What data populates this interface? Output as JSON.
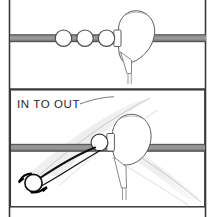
{
  "figure": {
    "panels": [
      {
        "id": "top-panel",
        "name": "square-path-panel",
        "caption": "",
        "elements": [
          {
            "name": "target-line",
            "type": "bar",
            "color": "#8c8c8c"
          },
          {
            "name": "golf-ball-1",
            "type": "ball",
            "color": "#ffffff"
          },
          {
            "name": "golf-ball-2",
            "type": "ball",
            "color": "#ffffff"
          },
          {
            "name": "golf-ball-3",
            "type": "ball",
            "color": "#ffffff"
          },
          {
            "name": "driver-club-head",
            "type": "clubhead",
            "color": "#ffffff"
          }
        ]
      },
      {
        "id": "bottom-panel",
        "name": "in-to-out-path-panel",
        "caption": "IN TO OUT",
        "elements": [
          {
            "name": "target-line",
            "type": "bar",
            "color": "#8c8c8c"
          },
          {
            "name": "swing-path-band",
            "type": "band",
            "color": "#f0f0f0"
          },
          {
            "name": "golf-ball-contact",
            "type": "ball",
            "color": "#ffffff"
          },
          {
            "name": "golf-ball-flight",
            "type": "ball",
            "color": "#ffffff"
          },
          {
            "name": "ball-flight-curve",
            "type": "curve",
            "color": "#1a1a1a"
          },
          {
            "name": "spin-arrow-upper",
            "type": "arrow",
            "color": "#000000"
          },
          {
            "name": "spin-arrow-lower",
            "type": "arrow",
            "color": "#000000"
          },
          {
            "name": "driver-club-head",
            "type": "clubhead",
            "color": "#ffffff"
          }
        ]
      }
    ],
    "colors": {
      "ink": "#1a1a1a",
      "line_gray": "#8c8c8c",
      "line_gray_dark": "#5a5a5a",
      "band_gray": "#efefef",
      "border": "#3a3a3a",
      "paper": "#ffffff",
      "text": "#2b2b2b"
    }
  }
}
